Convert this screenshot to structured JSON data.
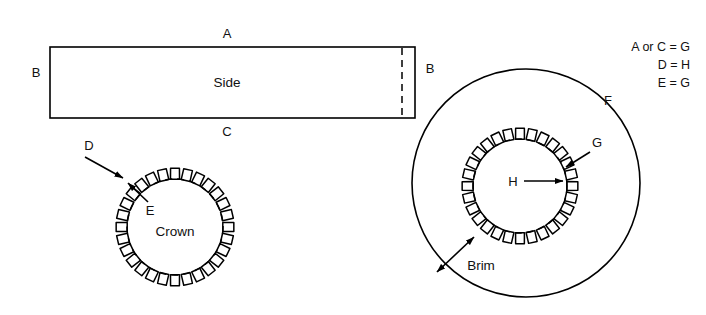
{
  "diagram": {
    "parts": {
      "side": {
        "label": "Side",
        "edge_top": "A",
        "edge_left": "B",
        "edge_right": "B",
        "edge_bottom": "C"
      },
      "crown": {
        "label": "Crown",
        "tab_label": "D",
        "seam_label": "E"
      },
      "brim": {
        "label": "Brim",
        "outer_label": "F",
        "seam_label": "G",
        "tab_label": "H"
      }
    },
    "legend": {
      "lines": [
        "A or C = G",
        "D = H",
        "E = G"
      ]
    },
    "colors": {
      "ink": "#000000",
      "paper": "#ffffff"
    }
  }
}
